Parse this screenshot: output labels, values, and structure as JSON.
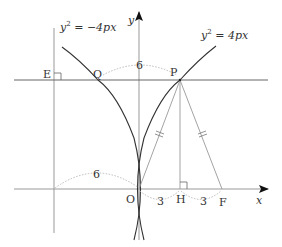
{
  "diagram": {
    "equations": {
      "right_parabola": {
        "base": "y",
        "exp": "2",
        "rhs": " = 4px"
      },
      "left_parabola": {
        "base": "y",
        "exp": "2",
        "rhs": " = −4px"
      }
    },
    "axes": {
      "x_label": "x",
      "y_label": "y"
    },
    "points": {
      "O": "O",
      "P": "P",
      "Q": "Q",
      "E": "E",
      "H": "H",
      "F": "F"
    },
    "measurements": {
      "OP_arc_top": "6",
      "OE_arc_left": "6",
      "OH": "3",
      "HF": "3"
    },
    "colors": {
      "curve": "#333333",
      "axis": "#888888",
      "line": "#555555",
      "dashed_arc": "#bbbbbb",
      "segment": "#999999"
    }
  }
}
